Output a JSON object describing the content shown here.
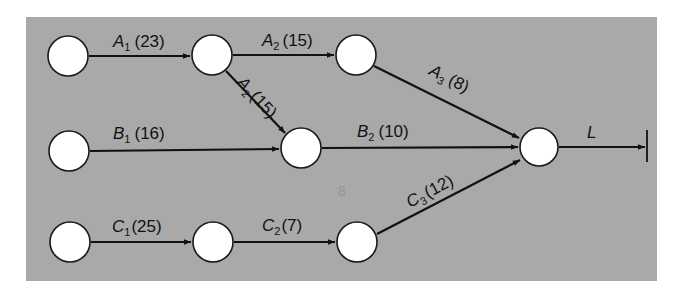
{
  "diagram": {
    "type": "activity-network",
    "colors": {
      "panel": "#a9a9a9",
      "node_fill": "#ffffff",
      "edge": "#111111"
    },
    "nodes": [
      {
        "id": "n1",
        "x": 68,
        "y": 56
      },
      {
        "id": "n2",
        "x": 212,
        "y": 55
      },
      {
        "id": "n3",
        "x": 356,
        "y": 55
      },
      {
        "id": "n4",
        "x": 69,
        "y": 151
      },
      {
        "id": "n5",
        "x": 301,
        "y": 148
      },
      {
        "id": "n6",
        "x": 539,
        "y": 147
      },
      {
        "id": "n7",
        "x": 70,
        "y": 242
      },
      {
        "id": "n8",
        "x": 213,
        "y": 242
      },
      {
        "id": "n9",
        "x": 357,
        "y": 242
      }
    ],
    "edges": [
      {
        "from": "n1",
        "to": "n2",
        "letter": "A",
        "sub": "1",
        "duration": "(23)"
      },
      {
        "from": "n2",
        "to": "n3",
        "letter": "A",
        "sub": "2",
        "duration": "(15)"
      },
      {
        "from": "n2",
        "to": "n5",
        "letter": "A",
        "sub": "2",
        "duration": "(15)"
      },
      {
        "from": "n3",
        "to": "n6",
        "letter": "A",
        "sub": "3",
        "duration": "(8)"
      },
      {
        "from": "n4",
        "to": "n5",
        "letter": "B",
        "sub": "1",
        "duration": "(16)"
      },
      {
        "from": "n5",
        "to": "n6",
        "letter": "B",
        "sub": "2",
        "duration": "(10)"
      },
      {
        "from": "n7",
        "to": "n8",
        "letter": "C",
        "sub": "1",
        "duration": "(25)"
      },
      {
        "from": "n8",
        "to": "n9",
        "letter": "C",
        "sub": "2",
        "duration": "(7)"
      },
      {
        "from": "n9",
        "to": "n6",
        "letter": "C",
        "sub": "3",
        "duration": "(12)"
      },
      {
        "from": "n6",
        "to": "end",
        "letter": "L",
        "sub": "",
        "duration": ""
      }
    ]
  },
  "labels": {
    "a1": {
      "letter": "A",
      "sub": "1",
      "dur": "(23)"
    },
    "a2_top": {
      "letter": "A",
      "sub": "2",
      "dur": "(15)"
    },
    "a2_diag": {
      "letter": "A",
      "sub": "2",
      "dur": "(15)"
    },
    "a3": {
      "letter": "A",
      "sub": "3",
      "dur": "(8)"
    },
    "b1": {
      "letter": "B",
      "sub": "1",
      "dur": "(16)"
    },
    "b2": {
      "letter": "B",
      "sub": "2",
      "dur": "(10)"
    },
    "c1": {
      "letter": "C",
      "sub": "1",
      "dur": "(25)"
    },
    "c2": {
      "letter": "C",
      "sub": "2",
      "dur": "(7)"
    },
    "c3": {
      "letter": "C",
      "sub": "3",
      "dur": "(12)"
    },
    "l": {
      "letter": "L"
    }
  }
}
